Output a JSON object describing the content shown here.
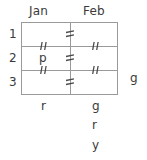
{
  "diagram": {
    "title_row": {
      "columns": [
        {
          "label": "Jan"
        },
        {
          "label": "Feb"
        }
      ]
    },
    "rows": [
      {
        "label": "1"
      },
      {
        "label": "2"
      },
      {
        "label": "3"
      }
    ],
    "cells": [
      {
        "row": "2",
        "column": "Jan",
        "value": "p"
      }
    ],
    "footer": {
      "jan": [
        "r"
      ],
      "feb": [
        "g",
        "r",
        "y"
      ]
    },
    "side": {
      "right_label": "g"
    },
    "marks": {
      "glyph_name": "not-equal-tick",
      "count": 7,
      "description": "double tick strike marks across grid lines"
    },
    "colors": {
      "line": "#9a9a9a",
      "text": "#3a3a3a",
      "mark": "#4a4a4a",
      "background": "#ffffff"
    }
  }
}
